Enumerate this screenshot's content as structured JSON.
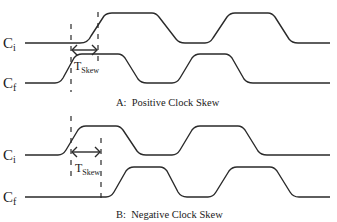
{
  "diagram": {
    "panels": [
      {
        "id": "A",
        "caption": "A:  Positive Clock Skew",
        "signals": [
          {
            "name": "C",
            "subscript": "i"
          },
          {
            "name": "C",
            "subscript": "f"
          }
        ],
        "skew_label": {
          "main": "T",
          "subscript": "Skew"
        }
      },
      {
        "id": "B",
        "caption": "B:  Negative Clock Skew",
        "signals": [
          {
            "name": "C",
            "subscript": "i"
          },
          {
            "name": "C",
            "subscript": "f"
          }
        ],
        "skew_label": {
          "main": "T",
          "subscript": "Skew"
        }
      }
    ],
    "colors": {
      "line": "#2a2a2a",
      "background": "#ffffff"
    }
  }
}
